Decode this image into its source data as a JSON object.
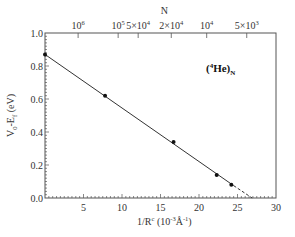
{
  "chart_data": {
    "type": "scatter",
    "title": "",
    "annotation": {
      "text_base": "(",
      "sup": "4",
      "text_main": "He)",
      "sub": "N"
    },
    "xlabel": {
      "base": "1/R",
      "sup1": "c",
      "rest1": " (10",
      "sup2": "-3",
      "rest2": "Å",
      "sup3": "-1",
      "rest3": ")"
    },
    "ylabel": {
      "base": "V",
      "sub1": "0",
      "mid": "-E",
      "sub2": "f",
      "rest": " (eV)"
    },
    "top_xlabel": "N",
    "xlim": [
      0,
      30
    ],
    "ylim": [
      0.0,
      1.0
    ],
    "x_ticks": [
      "5",
      "10",
      "15",
      "20",
      "25",
      "30"
    ],
    "x_tick_values": [
      5,
      10,
      15,
      20,
      25,
      30
    ],
    "y_ticks": [
      "0.0",
      "0.2",
      "0.4",
      "0.6",
      "0.8",
      "1.0"
    ],
    "y_tick_values": [
      0.0,
      0.2,
      0.4,
      0.6,
      0.8,
      1.0
    ],
    "top_ticks": [
      {
        "label": "10",
        "sup": "6",
        "x": 4.3
      },
      {
        "label": "10",
        "sup": "5",
        "x": 9.5
      },
      {
        "label": "5×10",
        "sup": "4",
        "x": 12.1
      },
      {
        "label": "2×10",
        "sup": "4",
        "x": 16.4
      },
      {
        "label": "10",
        "sup": "4",
        "x": 21.0
      },
      {
        "label": "5×10",
        "sup": "3",
        "x": 26.2
      }
    ],
    "series": [
      {
        "name": "(4He)N data",
        "x": [
          0.0,
          7.8,
          16.7,
          22.3,
          24.2
        ],
        "y": [
          0.87,
          0.62,
          0.34,
          0.14,
          0.08
        ]
      }
    ],
    "fit_line": {
      "x_start": 0.0,
      "y_start": 0.87,
      "x_solid_end": 24.5,
      "y_solid_end": 0.075,
      "x_dashed_end": 26.9,
      "y_dashed_end": 0.0
    },
    "grid": false,
    "legend": "none"
  }
}
